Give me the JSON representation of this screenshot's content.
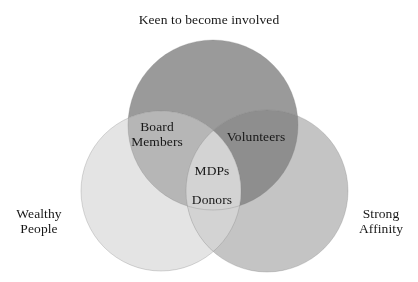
{
  "figure": {
    "type": "venn",
    "title": "Keen to become involved",
    "background_color": "#ffffff",
    "text_color": "#171717",
    "sets": [
      {
        "id": "keen",
        "label": "Keen to become involved",
        "label_position": "top",
        "color": "#9a9a9a",
        "cx": 213,
        "cy": 125,
        "r": 85
      },
      {
        "id": "wealthy",
        "label": "Wealthy\nPeople",
        "label_position": "left",
        "color": "#e4e4e4",
        "cx": 161,
        "cy": 191,
        "r": 80
      },
      {
        "id": "affinity",
        "label": "Strong\nAffinity",
        "label_position": "right",
        "color": "#c4c4c4",
        "cx": 267,
        "cy": 191,
        "r": 81
      }
    ],
    "regions": [
      {
        "id": "board-members",
        "label": "Board\nMembers",
        "sets": [
          "keen",
          "wealthy"
        ],
        "color": "#b6b6b6"
      },
      {
        "id": "volunteers",
        "label": "Volunteers",
        "sets": [
          "keen",
          "affinity"
        ],
        "color": "#8e8e8e"
      },
      {
        "id": "mdps",
        "label": "MDPs",
        "sets": [
          "keen",
          "wealthy",
          "affinity"
        ],
        "color": "#d8d8d8"
      },
      {
        "id": "donors",
        "label": "Donors",
        "sets": [
          "wealthy",
          "affinity"
        ],
        "color": "#d3d3d3"
      }
    ]
  }
}
